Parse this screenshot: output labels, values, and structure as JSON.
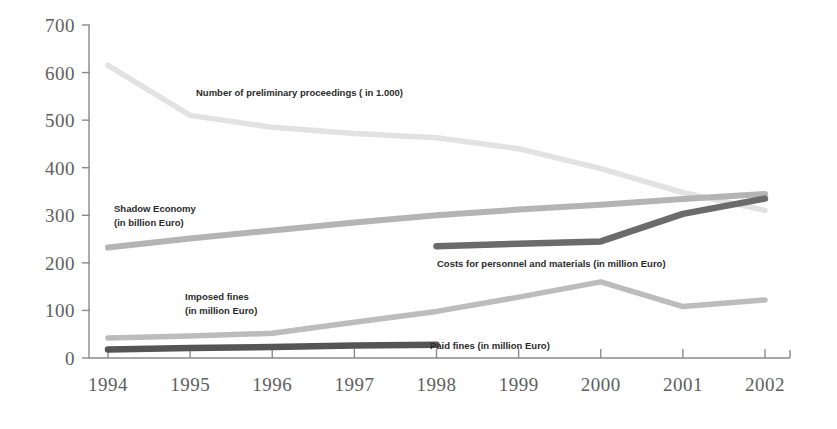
{
  "chart_data": {
    "type": "line",
    "title": "",
    "subtitle": "",
    "xlabel": "",
    "ylabel": "",
    "categories": [
      "1994",
      "1995",
      "1996",
      "1997",
      "1998",
      "1999",
      "2000",
      "2001",
      "2002"
    ],
    "x_tick_labels": [
      "1994",
      "1995",
      "1996",
      "1997",
      "1998",
      "1999",
      "2000",
      "2001",
      "2002"
    ],
    "y_tick_labels": [
      "0",
      "100",
      "200",
      "300",
      "400",
      "500",
      "600",
      "700"
    ],
    "y_ticks": [
      0,
      100,
      200,
      300,
      400,
      500,
      600,
      700
    ],
    "ylim": [
      0,
      700
    ],
    "xlim": [
      "1994",
      "2002"
    ],
    "grid": false,
    "legend_position": "inline-annotations",
    "series": [
      {
        "name": "Number of preliminary proceedings ( in 1.000)",
        "label": "Number of preliminary proceedings ( in 1.000)",
        "color": "#e2e2e2",
        "x": [
          "1994",
          "1995",
          "1996",
          "1997",
          "1998",
          "1999",
          "2000",
          "2001",
          "2002"
        ],
        "values": [
          615,
          510,
          485,
          472,
          463,
          440,
          398,
          348,
          310
        ]
      },
      {
        "name": "Shadow Economy (in billion Euro)",
        "label_line1": "Shadow Economy",
        "label_line2": "(in billion Euro)",
        "color": "#b4b4b4",
        "x": [
          "1994",
          "1995",
          "1996",
          "1997",
          "1998",
          "1999",
          "2000",
          "2001",
          "2002"
        ],
        "values": [
          232,
          251,
          268,
          285,
          300,
          312,
          322,
          334,
          345
        ]
      },
      {
        "name": "Costs for personnel and materials (in million Euro)",
        "label": "Costs for personnel and materials (in million Euro)",
        "color": "#6b6b6b",
        "x": [
          "1998",
          "1999",
          "2000",
          "2001",
          "2002"
        ],
        "values": [
          235,
          240,
          245,
          303,
          335
        ]
      },
      {
        "name": "Imposed fines (in million Euro)",
        "label_line1": "Imposed fines",
        "label_line2": "(in million Euro)",
        "color": "#bcbcbc",
        "x": [
          "1994",
          "1995",
          "1996",
          "1997",
          "1998",
          "1999",
          "2000",
          "2001",
          "2002"
        ],
        "values": [
          42,
          46,
          52,
          75,
          98,
          128,
          160,
          108,
          122
        ]
      },
      {
        "name": "Paid fines (in million Euro)",
        "label": "Paid fines (in million Euro)",
        "color": "#555555",
        "x": [
          "1994",
          "1995",
          "1996",
          "1997",
          "1998"
        ],
        "values": [
          18,
          21,
          23,
          26,
          28
        ]
      }
    ],
    "annotations": [
      {
        "id": "ann-proceedings",
        "text": "Number of preliminary proceedings ( in 1.000)",
        "x_px": 196,
        "y_px": 96
      },
      {
        "id": "ann-shadow-1",
        "text": "Shadow Economy",
        "x_px": 114,
        "y_px": 212
      },
      {
        "id": "ann-shadow-2",
        "text": "(in billion Euro)",
        "x_px": 114,
        "y_px": 226
      },
      {
        "id": "ann-costs",
        "text": "Costs for personnel and materials (in million Euro)",
        "x_px": 437,
        "y_px": 267
      },
      {
        "id": "ann-imposed-1",
        "text": "Imposed fines",
        "x_px": 185,
        "y_px": 300
      },
      {
        "id": "ann-imposed-2",
        "text": "(in million Euro)",
        "x_px": 185,
        "y_px": 314
      },
      {
        "id": "ann-paid",
        "text": "Paid fines (in million Euro)",
        "x_px": 430,
        "y_px": 349
      }
    ]
  }
}
